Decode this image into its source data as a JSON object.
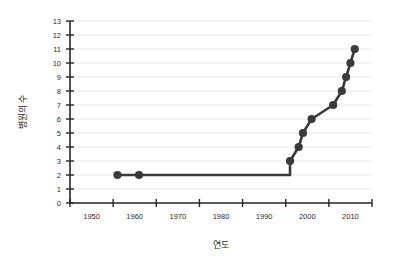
{
  "chart_data": {
    "type": "line",
    "title": "",
    "subtitle": "",
    "xlabel": "연도",
    "ylabel": "병원의 수",
    "xlim": [
      1945,
      2015
    ],
    "ylim": [
      0,
      13
    ],
    "x_tick_labels": [
      "1950",
      "1960",
      "1970",
      "1980",
      "1990",
      "2000",
      "2010"
    ],
    "x_tick_values": [
      1950,
      1960,
      1970,
      1980,
      1990,
      2000,
      2010
    ],
    "x_minor_tick_values": [
      1945,
      1955,
      1965,
      1975,
      1985,
      1995,
      2005,
      2015
    ],
    "y_tick_labels": [
      "0",
      "1",
      "2",
      "3",
      "4",
      "5",
      "6",
      "7",
      "8",
      "9",
      "10",
      "11",
      "12",
      "13"
    ],
    "y_tick_values": [
      0,
      1,
      2,
      3,
      4,
      5,
      6,
      7,
      8,
      9,
      10,
      11,
      12,
      13
    ],
    "grid": "horizontal",
    "legend": "none",
    "marker": "circle",
    "series": [
      {
        "name": "병원의 수",
        "color": "#3a3a3a",
        "x": [
          1956,
          1961,
          1996,
          1996,
          1998,
          1999,
          2001,
          2006,
          2008,
          2009,
          2010,
          2011
        ],
        "values": [
          2,
          2,
          2,
          3,
          4,
          5,
          6,
          7,
          8,
          9,
          10,
          11
        ],
        "markers_shown": [
          true,
          true,
          false,
          true,
          true,
          true,
          true,
          true,
          true,
          true,
          true,
          true
        ]
      }
    ],
    "annotations": []
  },
  "axes": {
    "y_axis_title": "병원의 수",
    "x_axis_title": "연도"
  },
  "colors": {
    "line": "#3a3a3a",
    "marker": "#3a3a3a",
    "grid": "#e9e9e9",
    "axis": "#262626",
    "background": "#ffffff",
    "text": "#2b2b2b"
  }
}
